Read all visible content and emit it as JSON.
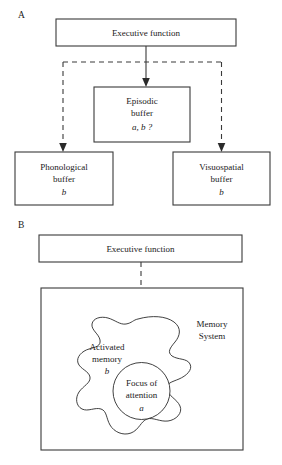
{
  "figure": {
    "background_color": "#ffffff",
    "line_color": "#3a3a3a",
    "text_color": "#1a1a1a"
  },
  "panel_a": {
    "label": "A",
    "executive": {
      "label": "Executive function"
    },
    "episodic": {
      "line1": "Episodic",
      "line2": "buffer",
      "line3": "a, b ?"
    },
    "phonological": {
      "line1": "Phonological",
      "line2": "buffer",
      "line3": "b"
    },
    "visuospatial": {
      "line1": "Visuospatial",
      "line2": "buffer",
      "line3": "b"
    },
    "connectors": [
      {
        "name": "executive-to-episodic",
        "style": "solid",
        "arrow": true
      },
      {
        "name": "executive-to-phonological",
        "style": "dashed",
        "arrow": true
      },
      {
        "name": "executive-to-visuospatial",
        "style": "dashed",
        "arrow": true
      }
    ]
  },
  "panel_b": {
    "label": "B",
    "executive": {
      "label": "Executive function"
    },
    "memory_system": {
      "line1": "Memory",
      "line2": "System"
    },
    "activated_memory": {
      "line1": "Activated",
      "line2": "memory",
      "line3": "b"
    },
    "focus_of_attention": {
      "line1": "Focus of",
      "line2": "attention",
      "line3": "a"
    },
    "connectors": [
      {
        "name": "executive-to-focus",
        "style": "dashed",
        "arrow": true
      }
    ]
  }
}
